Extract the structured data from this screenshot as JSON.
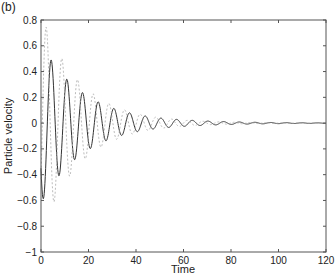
{
  "panel_label": "(b)",
  "chart_data": {
    "type": "line",
    "title": "",
    "xlabel": "Time",
    "ylabel": "Particle velocity",
    "xlim": [
      0,
      120
    ],
    "ylim": [
      -1,
      0.8
    ],
    "xticks": [
      0,
      20,
      40,
      60,
      80,
      100,
      120
    ],
    "yticks": [
      -1,
      -0.8,
      -0.6,
      -0.4,
      -0.2,
      0,
      0.2,
      0.4,
      0.6,
      0.8
    ],
    "ytick_labels": [
      "−1",
      "−0.8",
      "−0.6",
      "−0.4",
      "−0.2",
      "0",
      "0.2",
      "0.4",
      "0.6",
      "0.8"
    ],
    "grid": false,
    "legend": null,
    "series": [
      {
        "name": "solid",
        "style": "solid",
        "color": "#333333",
        "amplitude": 0.62,
        "decay": 0.055,
        "period": 6.6,
        "phase": 0.6,
        "peaks": [
          {
            "t": 1.7,
            "v": -0.5
          },
          {
            "t": 4.5,
            "v": 0.6
          },
          {
            "t": 7.8,
            "v": -0.62
          },
          {
            "t": 11.0,
            "v": 0.57
          },
          {
            "t": 14.5,
            "v": -0.48
          },
          {
            "t": 17.5,
            "v": 0.37
          },
          {
            "t": 21.0,
            "v": -0.25
          },
          {
            "t": 24.5,
            "v": 0.15
          },
          {
            "t": 28.0,
            "v": -0.12
          },
          {
            "t": 31.0,
            "v": 0.13
          },
          {
            "t": 34.5,
            "v": -0.14
          },
          {
            "t": 38.0,
            "v": 0.13
          }
        ]
      },
      {
        "name": "dashed",
        "style": "dashed",
        "color": "#aaaaaa",
        "amplitude": 0.85,
        "decay": 0.06,
        "period": 6.6,
        "phase": 2.6,
        "peaks": [
          {
            "t": 0.5,
            "v": -0.85
          },
          {
            "t": 3.3,
            "v": 0.7
          },
          {
            "t": 25.0,
            "v": 0.27
          },
          {
            "t": 31.5,
            "v": 0.2
          }
        ]
      }
    ]
  }
}
